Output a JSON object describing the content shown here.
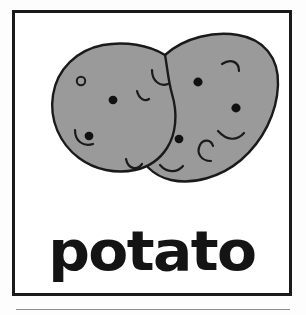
{
  "card": {
    "word": "potato",
    "illustration_name": "two-potatoes",
    "border_color": "#1a1a1a",
    "background_color": "#ffffff",
    "text_color": "#141414"
  },
  "illustration": {
    "subject": "potato",
    "count": 2,
    "fill_color": "#9a9a9a",
    "outline_color": "#1a1a1a",
    "eye_dot_color": "#111111",
    "description": "two overlapping oval potatoes drawn with dark eye spots and small curved sprout marks"
  },
  "page": {
    "background_color": "#fdfdfd",
    "rule_color": "#8c8c8c"
  }
}
